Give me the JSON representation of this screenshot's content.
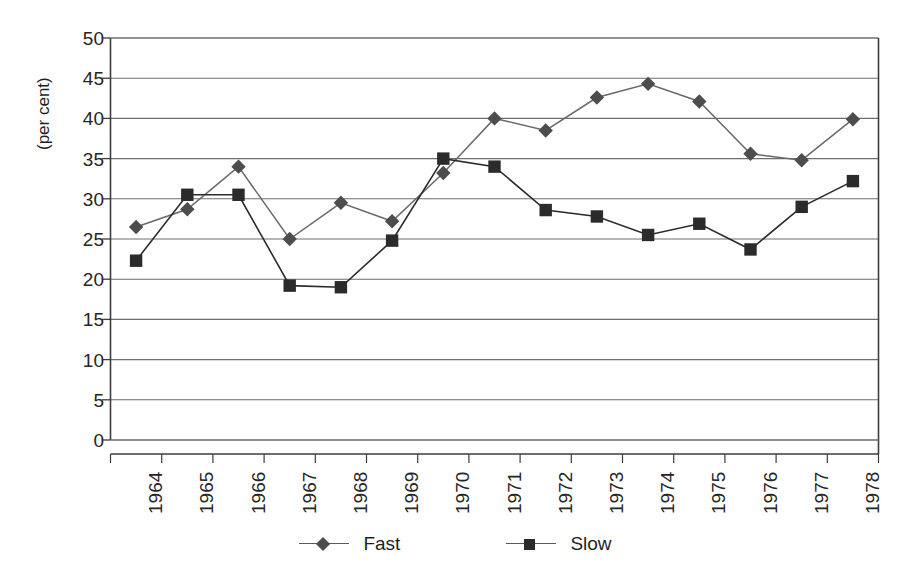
{
  "chart_data": {
    "type": "line",
    "title": "",
    "xlabel": "",
    "ylabel": "(per cent)",
    "categories": [
      "1964",
      "1965",
      "1966",
      "1967",
      "1968",
      "1969",
      "1970",
      "1971",
      "1972",
      "1973",
      "1974",
      "1975",
      "1976",
      "1977",
      "1978"
    ],
    "ylim": [
      0,
      50
    ],
    "yticks": [
      0,
      5,
      10,
      15,
      20,
      25,
      30,
      35,
      40,
      45,
      50
    ],
    "grid": "horizontal",
    "legend_position": "bottom",
    "series": [
      {
        "name": "Fast",
        "marker": "diamond",
        "color": "#4d4d4d",
        "values": [
          26.5,
          28.7,
          34.0,
          25.0,
          29.5,
          27.2,
          33.2,
          40.0,
          38.5,
          42.6,
          44.3,
          42.1,
          35.6,
          34.8,
          39.9
        ]
      },
      {
        "name": "Slow",
        "marker": "square",
        "color": "#2b2b2b",
        "values": [
          22.3,
          30.5,
          30.5,
          19.2,
          19.0,
          24.8,
          35.0,
          34.0,
          28.6,
          27.8,
          25.5,
          26.9,
          23.7,
          29.0,
          32.2
        ]
      }
    ]
  },
  "axis": {
    "ytick_labels": [
      "50",
      "45",
      "40",
      "35",
      "30",
      "25",
      "20",
      "15",
      "10",
      "5",
      "0"
    ],
    "ylabel_text": "(per cent)"
  },
  "legend": {
    "items": [
      {
        "label": "Fast",
        "marker": "diamond-icon"
      },
      {
        "label": "Slow",
        "marker": "square-icon"
      }
    ]
  }
}
